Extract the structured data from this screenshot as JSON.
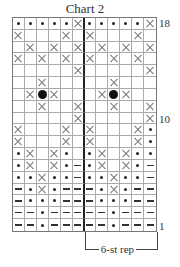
{
  "title": "Chart 2",
  "row_labels": [
    {
      "label": "18",
      "row": 18
    },
    {
      "label": "10",
      "row": 10
    },
    {
      "label": "1",
      "row": 1
    }
  ],
  "repeat": {
    "label": "6-st rep",
    "from_col": 7,
    "to_col": 12
  },
  "legend_symbols": {
    "dot": "purl-dot",
    "x": "cross-x",
    "bobble": "bobble",
    "dash": "dash",
    "blank": "empty"
  },
  "rows": {
    "18": [
      "dot",
      "dot",
      "dot",
      "dot",
      "dot",
      "x",
      "dot",
      "dot",
      "dot",
      "dot",
      "dot",
      "x"
    ],
    "17": [
      "x",
      "blank",
      "blank",
      "blank",
      "x",
      "blank",
      "x",
      "blank",
      "blank",
      "blank",
      "x",
      "blank"
    ],
    "16": [
      "blank",
      "x",
      "blank",
      "x",
      "blank",
      "x",
      "blank",
      "x",
      "blank",
      "x",
      "blank",
      "x"
    ],
    "15": [
      "x",
      "blank",
      "x",
      "blank",
      "x",
      "blank",
      "x",
      "blank",
      "x",
      "blank",
      "x",
      "blank"
    ],
    "14": [
      "blank",
      "blank",
      "blank",
      "blank",
      "blank",
      "x",
      "blank",
      "blank",
      "blank",
      "blank",
      "blank",
      "x"
    ],
    "13": [
      "blank",
      "blank",
      "x",
      "blank",
      "blank",
      "blank",
      "blank",
      "blank",
      "x",
      "blank",
      "blank",
      "blank"
    ],
    "12": [
      "blank",
      "x",
      "bobble",
      "x",
      "blank",
      "blank",
      "blank",
      "x",
      "bobble",
      "x",
      "blank",
      "blank"
    ],
    "11": [
      "blank",
      "blank",
      "x",
      "blank",
      "blank",
      "x",
      "blank",
      "blank",
      "x",
      "blank",
      "blank",
      "x"
    ],
    "10": [
      "blank",
      "blank",
      "blank",
      "blank",
      "blank",
      "x",
      "blank",
      "blank",
      "blank",
      "blank",
      "blank",
      "x"
    ],
    "9": [
      "x",
      "blank",
      "blank",
      "blank",
      "x",
      "blank",
      "x",
      "blank",
      "blank",
      "blank",
      "x",
      "dot"
    ],
    "8": [
      "x",
      "blank",
      "blank",
      "blank",
      "x",
      "blank",
      "x",
      "blank",
      "blank",
      "blank",
      "x",
      "dot"
    ],
    "7": [
      "dot",
      "x",
      "blank",
      "x",
      "dot",
      "blank",
      "dot",
      "x",
      "blank",
      "x",
      "dot",
      "dot"
    ],
    "6": [
      "dot",
      "x",
      "blank",
      "x",
      "dot",
      "dash",
      "dot",
      "x",
      "blank",
      "x",
      "dot",
      "dash"
    ],
    "5": [
      "dot",
      "dot",
      "x",
      "dot",
      "dot",
      "dash",
      "dot",
      "dot",
      "x",
      "dot",
      "dot",
      "dash"
    ],
    "4": [
      "dash",
      "dot",
      "x",
      "dot",
      "dash",
      "dash",
      "dash",
      "dot",
      "x",
      "dot",
      "dash",
      "dash"
    ],
    "3": [
      "dash",
      "dot",
      "dot",
      "dot",
      "dash",
      "dash",
      "dash",
      "dot",
      "dot",
      "dot",
      "dash",
      "dash"
    ],
    "2": [
      "dash",
      "dash",
      "dot",
      "dash",
      "dash",
      "dash",
      "dash",
      "dash",
      "dot",
      "dash",
      "dash",
      "dash"
    ],
    "1": [
      "dash",
      "dash",
      "dot",
      "dash",
      "dash",
      "dash",
      "dash",
      "dash",
      "dot",
      "dash",
      "dash",
      "dash"
    ]
  }
}
